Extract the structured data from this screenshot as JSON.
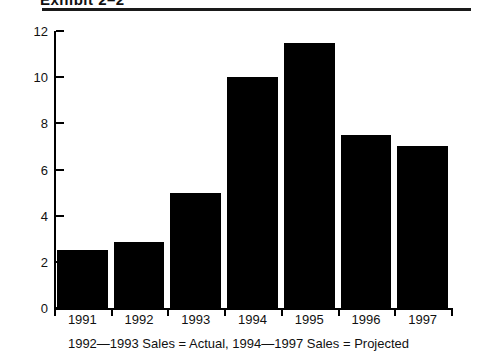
{
  "header": {
    "exhibit_title": "Exhibit 2–2"
  },
  "caption": "1992—1993 Sales = Actual, 1994—1997 Sales = Projected",
  "colors": {
    "bar": "#000000",
    "axis": "#000000",
    "text": "#111111",
    "background": "#ffffff"
  },
  "chart_data": {
    "type": "bar",
    "title": "Exhibit 2–2",
    "categories": [
      "1991",
      "1992",
      "1993",
      "1994",
      "1995",
      "1996",
      "1997"
    ],
    "values": [
      2.5,
      2.85,
      5.0,
      10.0,
      11.5,
      7.5,
      7.0
    ],
    "xlabel": "",
    "ylabel": "",
    "ylim": [
      0,
      12
    ],
    "yticks": [
      0,
      2,
      4,
      6,
      8,
      10,
      12
    ],
    "ytick_labels": [
      "0",
      "2",
      "4",
      "6",
      "8",
      "10",
      "12"
    ],
    "grid": false,
    "legend": false,
    "annotation": "1992—1993 Sales = Actual, 1994—1997 Sales = Projected"
  }
}
